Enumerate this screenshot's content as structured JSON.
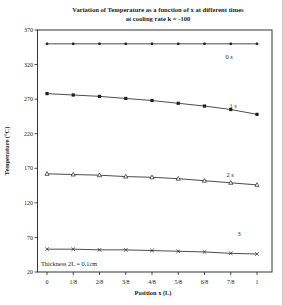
{
  "title": {
    "line1": "Variation of Temperature as a function of x at different times",
    "line2": "at cooling rate k = -100"
  },
  "axes": {
    "y_label": "Temperature (°C)",
    "x_label": "Position x (L)",
    "y_ticks": [
      "370",
      "320",
      "270",
      "220",
      "170",
      "120",
      "70",
      "20"
    ],
    "x_ticks": [
      "0",
      "1/8",
      "2/8",
      "3/8",
      "4/8",
      "5/8",
      "6/8",
      "7/8",
      "1"
    ]
  },
  "annotation": "Thickness 2L = 0.1cm",
  "chart_data": {
    "type": "line",
    "title": "Variation of Temperature as a function of x at different times at cooling rate k = -100",
    "xlabel": "Position x (L)",
    "ylabel": "Temperature (°C)",
    "x_categories": [
      "0",
      "1/8",
      "2/8",
      "3/8",
      "4/8",
      "5/8",
      "6/8",
      "7/8",
      "1"
    ],
    "ylim": [
      20,
      370
    ],
    "grid": false,
    "legend_position": "inline-right",
    "line_color": "#1f1f1f",
    "background_color": "#ffffff",
    "series": [
      {
        "name": "0 s",
        "marker": "filled-circle",
        "values": [
          350,
          350,
          350,
          350,
          350,
          350,
          350,
          350,
          350
        ]
      },
      {
        "name": "1 s",
        "marker": "filled-square",
        "values": [
          278,
          276,
          274,
          271,
          268,
          264,
          260,
          255,
          248
        ]
      },
      {
        "name": "2 s",
        "marker": "open-triangle",
        "values": [
          162,
          161,
          160,
          158,
          157,
          155,
          152,
          149,
          146
        ]
      },
      {
        "name": "3",
        "marker": "x-cross",
        "values": [
          53,
          53,
          52,
          52,
          51,
          50,
          49,
          47,
          46
        ]
      }
    ]
  }
}
